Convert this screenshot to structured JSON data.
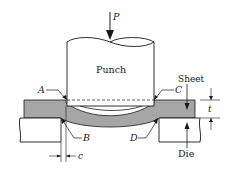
{
  "diagram": {
    "colors": {
      "sheet_fill": "#a6a6a6",
      "outline": "#1a1a1a",
      "background": "#ffffff"
    },
    "labels": {
      "force": "P",
      "punch": "Punch",
      "sheet": "Sheet",
      "die": "Die",
      "point_a": "A",
      "point_b": "B",
      "point_c": "C",
      "point_d": "D",
      "thickness": "t",
      "clearance": "c"
    }
  }
}
